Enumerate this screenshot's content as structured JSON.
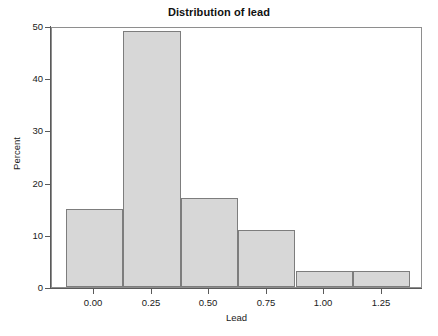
{
  "chart_data": {
    "type": "bar",
    "title": "Distribution of lead",
    "xlabel": "Lead",
    "ylabel": "Percent",
    "grid": false,
    "legend": null,
    "xlim": [
      -0.185,
      1.43
    ],
    "ylim": [
      0,
      50
    ],
    "xticks": [
      "0.00",
      "0.25",
      "0.50",
      "0.75",
      "1.00",
      "1.25"
    ],
    "xtick_values": [
      0.0,
      0.25,
      0.5,
      0.75,
      1.0,
      1.25
    ],
    "yticks": [
      "0",
      "10",
      "20",
      "30",
      "40",
      "50"
    ],
    "ytick_values": [
      0,
      10,
      20,
      30,
      40,
      50
    ],
    "bin_width": 0.25,
    "bin_edges": [
      -0.125,
      0.125,
      0.375,
      0.625,
      0.875,
      1.125,
      1.375
    ],
    "bin_centers": [
      0.0,
      0.25,
      0.5,
      0.75,
      1.0,
      1.25
    ],
    "categories": [
      "0.00",
      "0.25",
      "0.50",
      "0.75",
      "1.00",
      "1.25"
    ],
    "values": [
      15,
      49,
      17,
      11,
      3,
      3
    ],
    "bar_fill": "#d7d7d7",
    "bar_border": "#7d7d7d",
    "axis_color": "#5a5a5a",
    "frame_color": "#8e8e8e",
    "background": "#ffffff"
  }
}
